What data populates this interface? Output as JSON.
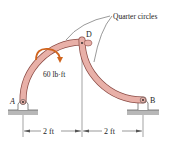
{
  "diagram": {
    "labels": {
      "quarter_circles": "Quarter circles",
      "point_a": "A",
      "point_b": "B",
      "point_d": "D",
      "moment": "60 lb·ft",
      "dim_left": "2 ft",
      "dim_right": "2 ft"
    },
    "colors": {
      "member_fill": "#e8b0a8",
      "member_stroke": "#8a4a44",
      "moment_arrow": "#d0641e",
      "ground": "#b8b8b8",
      "line": "#444444"
    }
  }
}
